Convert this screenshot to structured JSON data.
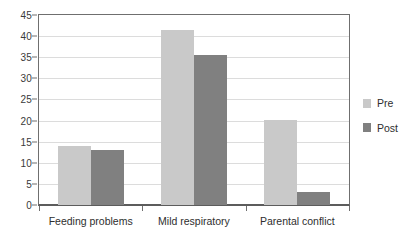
{
  "chart_data": {
    "type": "bar",
    "title": "",
    "subtitle": "",
    "xlabel": "",
    "ylabel": "",
    "categories": [
      "Feeding problems",
      "Mild respiratory",
      "Parental conflict"
    ],
    "series": [
      {
        "name": "Pre",
        "values": [
          14.0,
          41.5,
          20.2
        ],
        "color": "#c9c9c9"
      },
      {
        "name": "Post",
        "values": [
          13.0,
          35.5,
          3.2
        ],
        "color": "#808080"
      }
    ],
    "ylim": [
      0,
      45
    ],
    "ytick_step": 5,
    "yticks": [
      0,
      5,
      10,
      15,
      20,
      25,
      30,
      35,
      40,
      45
    ],
    "ytick_labels": [
      "0",
      "5",
      "10",
      "15",
      "20",
      "25",
      "30",
      "35",
      "40",
      "45"
    ],
    "grid": true,
    "grid_axis": "y",
    "legend": true,
    "legend_position": "right",
    "legend_entries": [
      "Pre",
      "Post"
    ],
    "background_color": "#ffffff",
    "axis_color": "#6f6f6f",
    "grid_color": "#dcdcdc"
  }
}
